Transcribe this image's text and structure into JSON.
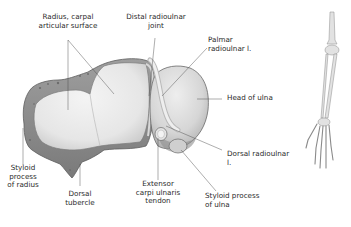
{
  "figure": {
    "colors": {
      "background": "#ffffff",
      "bone_fill": "#e9e9e9",
      "bone_shadow": "#a8a8a8",
      "bone_outline": "#6a6a6a",
      "leader_line": "#4a4a4a",
      "text": "#2a2a2a"
    },
    "labels": {
      "radius_carpal_surface": {
        "line1": "Radius, carpal",
        "line2": "articular surface"
      },
      "distal_radioulnar_joint": {
        "line1": "Distal radioulnar",
        "line2": "joint"
      },
      "palmar_radioulnar_lig": {
        "line1": "Palmar",
        "line2": "radioulnar l."
      },
      "head_of_ulna": {
        "line1": "Head of ulna"
      },
      "dorsal_radioulnar_lig": {
        "line1": "Dorsal radioulnar",
        "line2": "l."
      },
      "styloid_process_radius": {
        "line1": "Styloid",
        "line2": "process",
        "line3": "of radius"
      },
      "dorsal_tubercle": {
        "line1": "Dorsal",
        "line2": "tubercle"
      },
      "extensor_carpi_ulnaris": {
        "line1": "Extensor",
        "line2": "carpi ulnaris",
        "line3": "tendon"
      },
      "styloid_process_ulna": {
        "line1": "Styloid process",
        "line2": "of ulna"
      }
    },
    "orientation_inset": {
      "description": "Skeleton of right upper limb (humerus, forearm, hand)"
    }
  }
}
